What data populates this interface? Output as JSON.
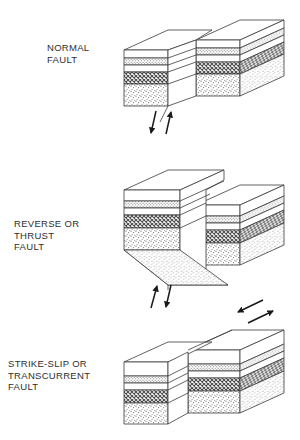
{
  "figure": {
    "background_color": "#ffffff",
    "line_color": "#3a3a3a",
    "text_color": "#2e2e2e"
  },
  "panels": [
    {
      "id": "normal-fault",
      "label": "NORMAL\nFAULT",
      "label_lines": [
        "NORMAL",
        "FAULT"
      ],
      "motion": "hanging wall drops down relative to footwall",
      "arrows": {
        "type": "dip-slip",
        "left_arrow": "down",
        "right_arrow": "up",
        "position": "below fault trace"
      }
    },
    {
      "id": "reverse-thrust-fault",
      "label": "REVERSE OR\nTHRUST\nFAULT",
      "label_lines": [
        "REVERSE OR",
        "THRUST",
        "FAULT"
      ],
      "motion": "hanging wall pushed up over footwall",
      "arrows": {
        "type": "dip-slip",
        "left_arrow": "up",
        "right_arrow": "down",
        "position": "below block"
      }
    },
    {
      "id": "strike-slip-fault",
      "label": "STRIKE-SLIP OR\nTRANSCURRENT\nFAULT",
      "label_lines": [
        "STRIKE-SLIP OR",
        "TRANSCURRENT",
        "FAULT"
      ],
      "motion": "blocks slide horizontally past one another",
      "arrows": {
        "type": "strike-slip",
        "left_arrow": "left",
        "right_arrow": "right",
        "position": "above block top surface"
      }
    }
  ],
  "strata": {
    "description": "Sedimentary layer sequence shown on each block face, top to bottom",
    "layers": [
      {
        "name": "upper-white-bed",
        "pattern": "blank",
        "fill": "#ffffff"
      },
      {
        "name": "fine-stipple-bed",
        "pattern": "fine-dots",
        "fill": "#d8d8d8"
      },
      {
        "name": "thin-white-bed",
        "pattern": "blank",
        "fill": "#ffffff"
      },
      {
        "name": "dark-hatch-bed",
        "pattern": "cross-hatch",
        "fill": "#8a8a8a"
      },
      {
        "name": "basal-stipple-bed",
        "pattern": "coarse-stipple",
        "fill": "#e4e4e4"
      }
    ]
  }
}
